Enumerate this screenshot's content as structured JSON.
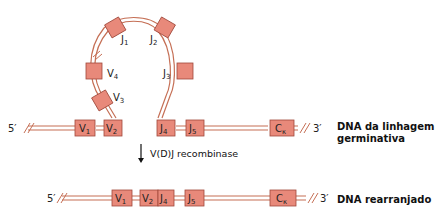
{
  "diagram": {
    "type": "vdj-recombination",
    "germline": {
      "end5": "5′",
      "end3": "3′",
      "label_line1": "DNA da linhagem",
      "label_line2": "germinativa",
      "segments_linear": [
        "V1",
        "V2",
        "J4",
        "J5",
        "Cκ"
      ],
      "loop_segments": [
        "V3",
        "V4",
        "J1",
        "J2",
        "J3"
      ]
    },
    "process": {
      "arrow_label": "V(D)J recombinase"
    },
    "rearranged": {
      "end5": "5′",
      "end3": "3′",
      "label": "DNA rearranjado",
      "segments": [
        "V1",
        "V2",
        "J4",
        "J5",
        "Cκ"
      ]
    },
    "colors": {
      "segment_fill": "#e8897a",
      "segment_stroke": "#a0483a",
      "strand": "#c56f55"
    }
  }
}
